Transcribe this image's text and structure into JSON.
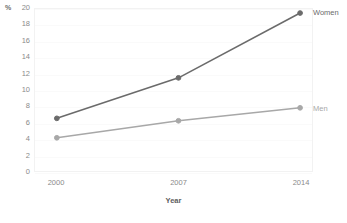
{
  "chart_data": {
    "type": "line",
    "title": "",
    "subtitle": "",
    "xlabel": "Year",
    "ylabel": "%",
    "x": [
      2000,
      2007,
      2014
    ],
    "categories": [
      "2000",
      "2007",
      "2014"
    ],
    "series": [
      {
        "name": "Women",
        "values": [
          6.5,
          11.5,
          19.5
        ],
        "color": "#6b6b6b",
        "marker": "circle"
      },
      {
        "name": "Men",
        "values": [
          4.1,
          6.2,
          7.8
        ],
        "color": "#a8a8a8",
        "marker": "circle"
      }
    ],
    "xlim": [
      2000,
      2014
    ],
    "ylim": [
      0,
      20
    ],
    "ytick_labels": [
      "20",
      "18",
      "16",
      "14",
      "12",
      "10",
      "8",
      "6",
      "4",
      "2",
      "0"
    ],
    "ytick_values": [
      20,
      18,
      16,
      14,
      12,
      10,
      8,
      6,
      4,
      2,
      0
    ],
    "xtick_labels": [
      "2000",
      "2007",
      "2014"
    ],
    "grid": true,
    "grid_axis": "y",
    "legend": "inline-right",
    "legend_entries": [
      "Women",
      "Men"
    ],
    "background_color": "#ffffff",
    "border_color": "#f2f2f2",
    "annotations": []
  },
  "axes": {
    "y_unit": "%",
    "x_title": "Year"
  }
}
